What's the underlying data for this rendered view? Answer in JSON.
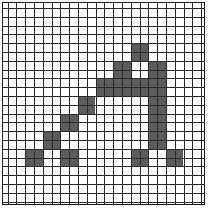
{
  "grid": {
    "columns": 23,
    "rows": 23,
    "cell_size_px": 8.8,
    "origin_x": 4.5,
    "origin_y": 5,
    "fill_color": "#5c5c5c",
    "line_color": "#2a2a2a",
    "background_color": "#ffffff",
    "filled_blocks": [
      {
        "col": 14,
        "row": 4,
        "w": 2,
        "h": 2
      },
      {
        "col": 12,
        "row": 6,
        "w": 2,
        "h": 2
      },
      {
        "col": 16,
        "row": 6,
        "w": 2,
        "h": 2
      },
      {
        "col": 10,
        "row": 8,
        "w": 8,
        "h": 2
      },
      {
        "col": 8,
        "row": 10,
        "w": 2,
        "h": 2
      },
      {
        "col": 16,
        "row": 10,
        "w": 2,
        "h": 6
      },
      {
        "col": 6,
        "row": 12,
        "w": 2,
        "h": 2
      },
      {
        "col": 4,
        "row": 14,
        "w": 2,
        "h": 2
      },
      {
        "col": 2,
        "row": 16,
        "w": 2,
        "h": 2
      },
      {
        "col": 6,
        "row": 16,
        "w": 2,
        "h": 2
      },
      {
        "col": 14,
        "row": 16,
        "w": 2,
        "h": 2
      },
      {
        "col": 18,
        "row": 16,
        "w": 2,
        "h": 2
      }
    ]
  }
}
